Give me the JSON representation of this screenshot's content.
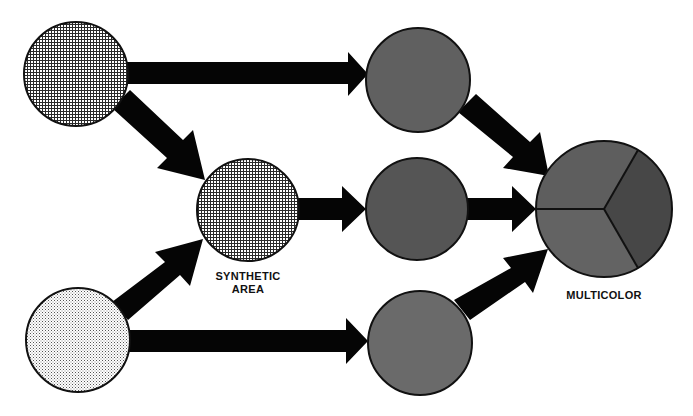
{
  "colors": {
    "arrow": "#050505",
    "outline": "#111111",
    "circle_top_right": "#606060",
    "circle_mid_right": "#555555",
    "circle_bot_right": "#6a6a6a",
    "pie_top": "#5e5e5e",
    "pie_right": "#474747",
    "pie_bottom": "#636363"
  },
  "nodes": [
    {
      "id": "input-top",
      "pattern": "dense-dot-screen",
      "cx": 76,
      "cy": 74,
      "r": 52
    },
    {
      "id": "input-bottom",
      "pattern": "light-dot-screen",
      "cx": 78,
      "cy": 340,
      "r": 52
    },
    {
      "id": "synthetic-area",
      "pattern": "dense-dot-screen",
      "cx": 248,
      "cy": 210,
      "r": 51,
      "label": [
        "SYNTHETIC",
        "AREA"
      ]
    },
    {
      "id": "color-top",
      "fill": "#606060",
      "cx": 418,
      "cy": 80,
      "r": 52
    },
    {
      "id": "color-middle",
      "fill": "#555555",
      "cx": 417,
      "cy": 209,
      "r": 51
    },
    {
      "id": "color-bottom",
      "fill": "#6a6a6a",
      "cx": 420,
      "cy": 343,
      "r": 52
    },
    {
      "id": "multicolor",
      "segments": 3,
      "cx": 604,
      "cy": 209,
      "r": 68,
      "label": [
        "MULTICOLOR"
      ]
    }
  ],
  "labels": {
    "synthetic_line1": "SYNTHETIC",
    "synthetic_line2": "AREA",
    "multicolor": "MULTICOLOR"
  },
  "edges": [
    {
      "from": "input-top",
      "to": "color-top"
    },
    {
      "from": "input-top",
      "to": "synthetic-area"
    },
    {
      "from": "input-bottom",
      "to": "synthetic-area"
    },
    {
      "from": "input-bottom",
      "to": "color-bottom"
    },
    {
      "from": "synthetic-area",
      "to": "color-middle"
    },
    {
      "from": "color-top",
      "to": "multicolor"
    },
    {
      "from": "color-middle",
      "to": "multicolor"
    },
    {
      "from": "color-bottom",
      "to": "multicolor"
    }
  ]
}
